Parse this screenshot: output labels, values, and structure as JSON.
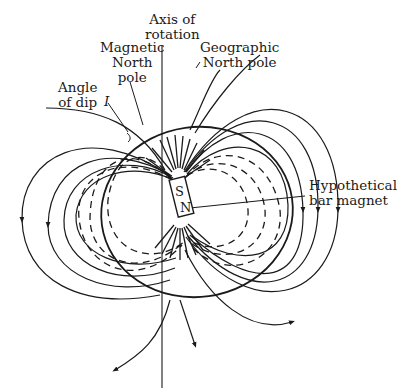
{
  "diagram": {
    "labels": {
      "axis_of_rotation": [
        "Axis of",
        "rotation"
      ],
      "magnetic_north_pole": [
        "Magnetic",
        "North",
        "pole"
      ],
      "geographic_north_pole": [
        "Geographic",
        "North pole"
      ],
      "angle_of_dip": [
        "Angle",
        "of dip"
      ],
      "angle_symbol": "I",
      "bar_magnet": [
        "Hypothetical",
        "bar magnet"
      ],
      "magnet_south": "S",
      "magnet_north": "N"
    },
    "colors": {
      "line": "#1a1a1a",
      "background": "#ffffff"
    }
  }
}
